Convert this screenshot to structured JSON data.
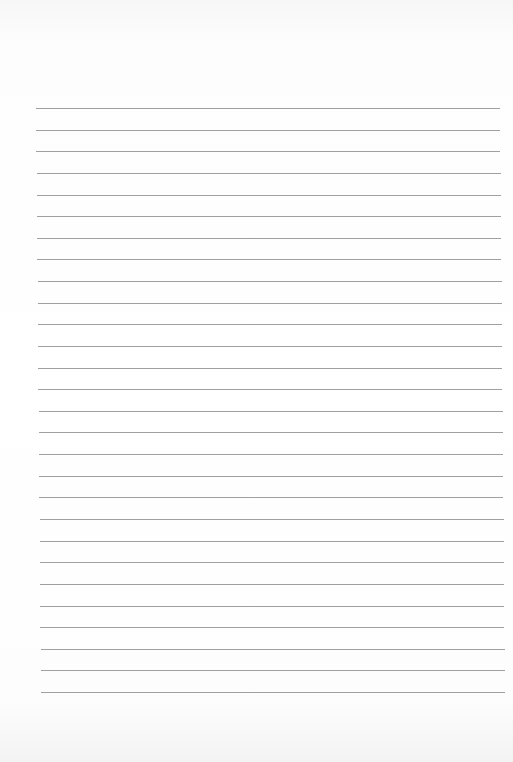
{
  "page": {
    "type": "lined-paper",
    "background_color": "#ffffff",
    "line_color": "#8f8f8f",
    "line_count": 28,
    "first_line_y": 108,
    "line_spacing": 21.63,
    "line_left_top": 36,
    "line_left_bottom": 41,
    "line_right_top": 500,
    "line_right_bottom": 505
  }
}
